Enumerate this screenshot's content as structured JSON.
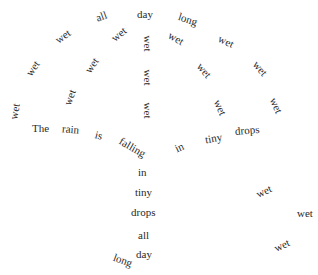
{
  "poem": {
    "title_line": "The rain is falling in tiny drops all day long",
    "words": [
      {
        "text": "all",
        "x": 96,
        "y": 11,
        "r": -20
      },
      {
        "text": "day",
        "x": 137,
        "y": 9,
        "r": 0
      },
      {
        "text": "long",
        "x": 178,
        "y": 14,
        "r": 18
      },
      {
        "text": "wet",
        "x": 55,
        "y": 31,
        "r": -35
      },
      {
        "text": "wet",
        "x": 111,
        "y": 29,
        "r": -40
      },
      {
        "text": "wet",
        "x": 140,
        "y": 38,
        "r": 90
      },
      {
        "text": "wet",
        "x": 168,
        "y": 33,
        "r": 30
      },
      {
        "text": "wet",
        "x": 218,
        "y": 36,
        "r": 25
      },
      {
        "text": "wet",
        "x": 25,
        "y": 63,
        "r": -55
      },
      {
        "text": "wet",
        "x": 84,
        "y": 60,
        "r": -55
      },
      {
        "text": "wet",
        "x": 140,
        "y": 72,
        "r": 90
      },
      {
        "text": "wet",
        "x": 196,
        "y": 65,
        "r": 50
      },
      {
        "text": "wet",
        "x": 252,
        "y": 63,
        "r": 50
      },
      {
        "text": "wet",
        "x": 62,
        "y": 92,
        "r": -70
      },
      {
        "text": "wet",
        "x": 140,
        "y": 105,
        "r": 90
      },
      {
        "text": "wet",
        "x": 212,
        "y": 102,
        "r": 65
      },
      {
        "text": "wet",
        "x": 268,
        "y": 100,
        "r": 65
      },
      {
        "text": "wet",
        "x": 7,
        "y": 106,
        "r": -80
      },
      {
        "text": "The",
        "x": 32,
        "y": 123,
        "r": 0
      },
      {
        "text": "rain",
        "x": 62,
        "y": 124,
        "r": 5
      },
      {
        "text": "is",
        "x": 95,
        "y": 130,
        "r": 15
      },
      {
        "text": "falling",
        "x": 118,
        "y": 142,
        "r": 30
      },
      {
        "text": "in",
        "x": 175,
        "y": 142,
        "r": -25
      },
      {
        "text": "tiny",
        "x": 205,
        "y": 133,
        "r": -10
      },
      {
        "text": "drops",
        "x": 235,
        "y": 125,
        "r": -5
      },
      {
        "text": "in",
        "x": 138,
        "y": 167,
        "r": 0
      },
      {
        "text": "tiny",
        "x": 135,
        "y": 187,
        "r": 0
      },
      {
        "text": "drops",
        "x": 131,
        "y": 207,
        "r": 0
      },
      {
        "text": "all",
        "x": 138,
        "y": 230,
        "r": 0
      },
      {
        "text": "day",
        "x": 136,
        "y": 249,
        "r": 0
      },
      {
        "text": "long",
        "x": 113,
        "y": 255,
        "r": 20
      },
      {
        "text": "wet",
        "x": 256,
        "y": 186,
        "r": -25
      },
      {
        "text": "wet",
        "x": 297,
        "y": 208,
        "r": 0
      },
      {
        "text": "wet",
        "x": 274,
        "y": 240,
        "r": -25
      }
    ]
  }
}
